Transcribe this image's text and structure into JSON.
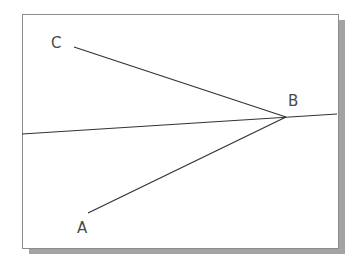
{
  "diagram": {
    "labels": {
      "A": "A",
      "B": "B",
      "C": "C"
    },
    "points": {
      "A": {
        "x": 88,
        "y": 213
      },
      "B": {
        "x": 286,
        "y": 117
      },
      "C": {
        "x": 74,
        "y": 47
      }
    },
    "line_through_B": {
      "x1": 22,
      "y1": 134,
      "x2": 337,
      "y2": 114
    },
    "colors": {
      "line": "#333333",
      "frame_border": "#8c8c8c",
      "shadow": "#a3a3a3",
      "label": "#4a4a4a"
    }
  }
}
